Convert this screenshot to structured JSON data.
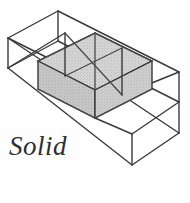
{
  "figure": {
    "caption": "Solid",
    "title": "Solid",
    "colors": {
      "background": "#ffffff",
      "line": "#3a3a3a",
      "line_light": "#555555",
      "fill_top": "#d2d2d2",
      "fill_left": "#c2c2c2",
      "fill_right": "#cbcbcb",
      "text": "#2e2e2e"
    },
    "line_width": 1.4,
    "geometry": {
      "type": "isometric-box",
      "cells_x": 3,
      "cells_y": 1,
      "cells_z": 1,
      "solid_cell_index": 1,
      "origin": {
        "x": 8,
        "y": 68
      },
      "step_u": {
        "dx": 57,
        "dy": -28.5
      },
      "step_v": {
        "dx": 57,
        "dy": 28.5
      },
      "step_w": {
        "dx": 0,
        "dy": -30
      }
    },
    "outer_box": {
      "label": "outer-wireframe-box",
      "vertices": {
        "back_top_left": {
          "x": 8,
          "y": 38
        },
        "back_top_far": {
          "x": 58,
          "y": 11
        },
        "front_top_right": {
          "x": 179,
          "y": 105
        },
        "front_bottom_left": {
          "x": 8,
          "y": 68
        },
        "front_bottom_mid": {
          "x": 132,
          "y": 165
        },
        "front_bottom_right": {
          "x": 179,
          "y": 133
        }
      }
    },
    "solid_cube": {
      "label": "shaded-solid-cube",
      "top_vertex": {
        "x": 95,
        "y": 33
      },
      "bottom_vertex": {
        "x": 95,
        "y": 118
      }
    }
  }
}
